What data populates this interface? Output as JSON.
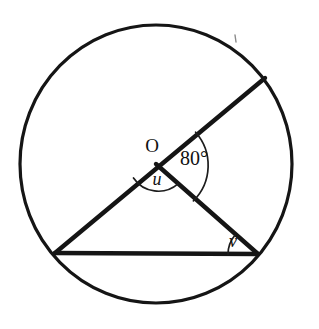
{
  "figure": {
    "type": "circle-geometry-diagram",
    "background_color": "#ffffff",
    "line_color": "#151515",
    "canvas": {
      "width": 319,
      "height": 329
    }
  },
  "circle": {
    "name": "main-circle",
    "center": {
      "x": 156,
      "y": 164
    },
    "radius": 136,
    "stroke_width": 3.2
  },
  "points": {
    "center": {
      "label": "O",
      "x": 156,
      "y": 164,
      "label_x": 152,
      "label_y": 148
    },
    "upper_right": {
      "label": "",
      "x": 265,
      "y": 78
    },
    "lower_left": {
      "label": "",
      "x": 55,
      "y": 253
    },
    "lower_right": {
      "label": "",
      "x": 258,
      "y": 254
    }
  },
  "segments": [
    {
      "name": "radius-upper-right",
      "from": "lower_left",
      "to": "upper_right",
      "note": "diameter-like line through O from lower-left vertex to upper-right point"
    },
    {
      "name": "radius-lower-right",
      "from": "center",
      "to": "lower_right"
    },
    {
      "name": "chord-base",
      "from": "lower_left",
      "to": "lower_right"
    }
  ],
  "angles": [
    {
      "name": "angle-at-centre-80",
      "label": "80°",
      "value": 80,
      "unit": "degrees",
      "vertex": "O",
      "arc_radius": 50,
      "label_x": 194,
      "label_y": 160
    },
    {
      "name": "angle-u",
      "label": "u",
      "vertex": "O",
      "arc_radius": 30,
      "label_x": 157,
      "label_y": 181
    },
    {
      "name": "angle-v",
      "label": "v",
      "vertex": "lower_right",
      "arc_radius": 30,
      "label_x": 233,
      "label_y": 243
    }
  ],
  "marks": [
    {
      "name": "stray-tick-mark",
      "x": 235,
      "y": 38
    }
  ]
}
